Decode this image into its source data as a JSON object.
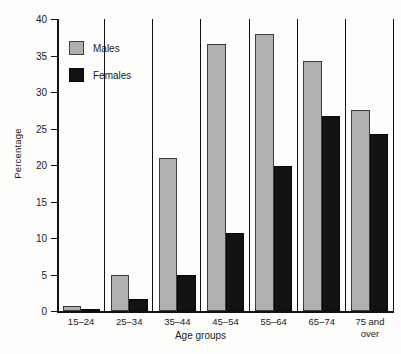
{
  "chart_data": {
    "type": "bar",
    "title": "",
    "xlabel": "Age groups",
    "ylabel": "Percentage",
    "categories": [
      "15–24",
      "25–34",
      "35–44",
      "45–54",
      "55–64",
      "65–74",
      "75 and\nover"
    ],
    "series": [
      {
        "name": "Males",
        "color": "#b0b0b0",
        "values": [
          0.7,
          5.0,
          20.9,
          36.6,
          37.9,
          34.2,
          27.6
        ]
      },
      {
        "name": "Females",
        "color": "#121212",
        "values": [
          0.3,
          1.6,
          4.9,
          10.7,
          19.9,
          26.7,
          24.2
        ]
      }
    ],
    "ylim": [
      0,
      40
    ],
    "yticks": [
      0,
      5,
      10,
      15,
      20,
      25,
      30,
      35,
      40
    ],
    "ytick_labels": [
      "0",
      "5",
      "10",
      "15",
      "20",
      "25",
      "30",
      "35",
      "40"
    ],
    "grid": false,
    "legend_position": "upper-left-inside"
  }
}
